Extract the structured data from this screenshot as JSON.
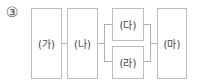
{
  "diagram": {
    "number_label": "③",
    "boxes": [
      {
        "id": "ga",
        "label": "(가)"
      },
      {
        "id": "na",
        "label": "(나)"
      },
      {
        "id": "da",
        "label": "(다)"
      },
      {
        "id": "ra",
        "label": "(라)"
      },
      {
        "id": "ma",
        "label": "(마)"
      }
    ],
    "structure": "(가) → (나) → parallel[(다), (라)] → (마)",
    "line_color": "#b0b0b0",
    "box_border_color": "#bdbdbd"
  }
}
